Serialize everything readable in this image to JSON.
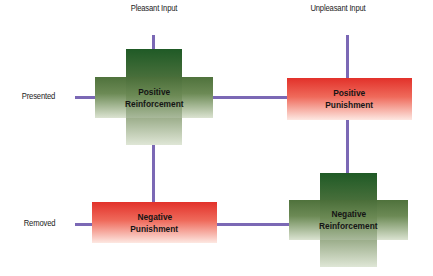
{
  "column_headers": {
    "pleasant": "Pleasant Input",
    "unpleasant": "Unpleasant Input"
  },
  "row_headers": {
    "presented": "Presented",
    "removed": "Removed"
  },
  "quadrants": {
    "positive_reinforcement": {
      "line1": "Positive",
      "line2": "Reinforcement",
      "shape": "cross",
      "color": "#3c6b34"
    },
    "positive_punishment": {
      "line1": "Positive",
      "line2": "Punishment",
      "shape": "rectangle",
      "color": "#e2312a"
    },
    "negative_punishment": {
      "line1": "Negative",
      "line2": "Punishment",
      "shape": "rectangle",
      "color": "#e2312a"
    },
    "negative_reinforcement": {
      "line1": "Negative",
      "line2": "Reinforcement",
      "shape": "cross",
      "color": "#3c6b34"
    }
  },
  "connector_color": "#7b68b5"
}
